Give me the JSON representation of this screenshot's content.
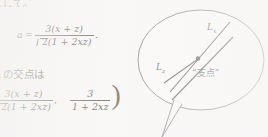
{
  "document": {
    "language": "ja",
    "ink_color": "#2b2927",
    "paper_color": "#f8f7f5"
  },
  "text_column": {
    "top_line_clipped": "入して。",
    "middle_line": {
      "leading_subscript": "xz",
      "text": "の交点は"
    }
  },
  "equations": {
    "equation_a": {
      "lhs": "a",
      "equals": "=",
      "numerator": "3(x + z)",
      "denominator_radicand": "2",
      "denominator_rest": "(1 + 2xz)",
      "trailing_punctuation": "."
    },
    "coordinate_pair": {
      "first_numerator": "3(x + z)",
      "first_denominator_radicand": "2",
      "first_denominator_rest": "(1 + 2xz)",
      "separator": ",",
      "second_numerator": "3",
      "second_denominator": "1 + 2xz",
      "closing_paren": ")"
    }
  },
  "diagram": {
    "kind": "speech-bubble-sketch",
    "label_lx": {
      "base": "L",
      "sub": "x"
    },
    "label_lz": {
      "base": "L",
      "sub": "z"
    },
    "fulcrum_label": "“支点”",
    "fulcrum_meaning": "fulcrum",
    "stroke_color": "#4a4846",
    "line_color": "#1f1d1c"
  }
}
